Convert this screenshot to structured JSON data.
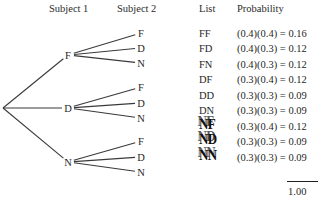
{
  "headers": {
    "subject1": "Subject 1",
    "subject2": "Subject 2",
    "list": "List",
    "probability": "Probability"
  },
  "tree": {
    "root": {
      "x": 3,
      "y": 108
    },
    "level1": [
      {
        "label": "F",
        "x": 68,
        "y": 55
      },
      {
        "label": "D",
        "x": 68,
        "y": 108
      },
      {
        "label": "N",
        "x": 68,
        "y": 162
      }
    ],
    "level2": [
      {
        "label": "F",
        "x": 141,
        "y": 33
      },
      {
        "label": "D",
        "x": 141,
        "y": 48
      },
      {
        "label": "N",
        "x": 141,
        "y": 63
      },
      {
        "label": "F",
        "x": 141,
        "y": 87
      },
      {
        "label": "D",
        "x": 141,
        "y": 103
      },
      {
        "label": "N",
        "x": 141,
        "y": 118
      },
      {
        "label": "F",
        "x": 141,
        "y": 141
      },
      {
        "label": "D",
        "x": 141,
        "y": 157
      },
      {
        "label": "N",
        "x": 141,
        "y": 172
      }
    ]
  },
  "rows": [
    {
      "list": "FF",
      "probability": "(0.4)(0.4) = 0.16",
      "y": 28,
      "artifact": false
    },
    {
      "list": "FD",
      "probability": "(0.4)(0.3) = 0.12",
      "y": 43,
      "artifact": false
    },
    {
      "list": "FN",
      "probability": "(0.4)(0.3) = 0.12",
      "y": 59,
      "artifact": false
    },
    {
      "list": "DF",
      "probability": "(0.3)(0.4) = 0.12",
      "y": 74,
      "artifact": false
    },
    {
      "list": "DD",
      "probability": "(0.3)(0.3) = 0.09",
      "y": 90,
      "artifact": false
    },
    {
      "list": "DN",
      "probability": "(0.3)(0.3) = 0.09",
      "y": 105,
      "artifact": false
    },
    {
      "list": "NF",
      "probability": "(0.3)(0.4) = 0.12",
      "y": 121,
      "artifact": true
    },
    {
      "list": "ND",
      "probability": "(0.3)(0.3) = 0.09",
      "y": 136,
      "artifact": true
    },
    {
      "list": "NN",
      "probability": "(0.3)(0.3) = 0.09",
      "y": 152,
      "artifact": true
    }
  ],
  "total": "1.00",
  "colors": {
    "ink": "#1f1f1f",
    "line": "#3a3a3a",
    "background": "#ffffff"
  }
}
